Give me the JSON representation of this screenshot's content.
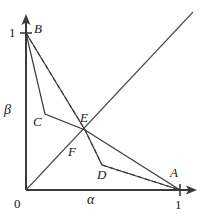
{
  "figure": {
    "title": "",
    "axes": {
      "x": {
        "label": "α",
        "origin_tick": "0",
        "end_tick": "1"
      },
      "y": {
        "label": "β",
        "end_tick": "1"
      }
    },
    "points": [
      {
        "id": "B",
        "label": "B",
        "alpha": 0.0,
        "beta": 1.0
      },
      {
        "id": "C",
        "label": "C",
        "alpha": 0.123,
        "beta": 0.484
      },
      {
        "id": "E",
        "label": "E",
        "alpha": 0.383,
        "beta": 0.382
      },
      {
        "id": "F",
        "label": "F",
        "alpha": 0.305,
        "beta": 0.242
      },
      {
        "id": "D",
        "label": "D",
        "alpha": 0.494,
        "beta": 0.159
      },
      {
        "id": "A",
        "label": "A",
        "alpha": 1.0,
        "beta": 0.0
      },
      {
        "id": "O",
        "label": "0",
        "alpha": 0.0,
        "beta": 0.0
      }
    ],
    "curves": [
      {
        "id": "solid-BCEA",
        "style": "solid",
        "vertices": [
          "B",
          "C",
          "E",
          "A"
        ]
      },
      {
        "id": "solid-BEDA",
        "style": "solid",
        "vertices": [
          "B",
          "E",
          "D",
          "A"
        ]
      },
      {
        "id": "dashed-BED",
        "style": "dashed",
        "vertices": [
          "B",
          "E",
          "D"
        ]
      },
      {
        "id": "dashed-DA",
        "style": "dashed",
        "vertices": [
          "D",
          "A"
        ]
      },
      {
        "id": "diagonal",
        "style": "solid",
        "vertices": [
          "O",
          "diagonal-end"
        ]
      }
    ],
    "colors": {
      "ink": "#1a1a1a",
      "background": "#ffffff"
    }
  }
}
